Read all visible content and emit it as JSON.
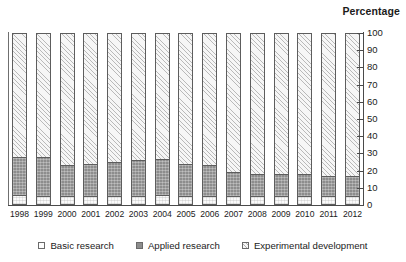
{
  "chart_data": {
    "type": "bar",
    "subtype": "stacked-percentage",
    "title": "Percentage",
    "xlabel": "",
    "ylabel": "Percentage",
    "ylim": [
      0,
      100
    ],
    "yticks": [
      0,
      10,
      20,
      30,
      40,
      50,
      60,
      70,
      80,
      90,
      100
    ],
    "grid": false,
    "legend_position": "bottom",
    "axis_side": "right",
    "categories": [
      "1998",
      "1999",
      "2000",
      "2001",
      "2002",
      "2003",
      "2004",
      "2005",
      "2006",
      "2007",
      "2008",
      "2009",
      "2010",
      "2011",
      "2012"
    ],
    "series": [
      {
        "name": "Basic research",
        "color": "#fafafa",
        "pattern": "light-speckle",
        "values": [
          6,
          5,
          5,
          5,
          5,
          5,
          6,
          5,
          5,
          5,
          5,
          5,
          5,
          5,
          5
        ]
      },
      {
        "name": "Applied research",
        "color": "#8d8d8d",
        "pattern": "dark-stipple",
        "values": [
          22,
          23,
          18,
          19,
          20,
          21,
          21,
          19,
          18,
          14,
          13,
          13,
          13,
          12,
          12
        ]
      },
      {
        "name": "Experimental development",
        "color": "#f2f2f2",
        "pattern": "diagonal-hatch",
        "values": [
          72,
          72,
          77,
          76,
          75,
          74,
          73,
          76,
          77,
          81,
          82,
          82,
          82,
          83,
          83
        ]
      }
    ],
    "stack_tops": {
      "basic_research": [
        6,
        5,
        5,
        5,
        5,
        5,
        6,
        5,
        5,
        5,
        5,
        5,
        5,
        5,
        5
      ],
      "applied_research_cumulative": [
        28,
        28,
        23,
        24,
        25,
        26,
        27,
        24,
        23,
        19,
        18,
        18,
        18,
        17,
        17
      ]
    }
  },
  "legend": {
    "items": [
      {
        "label": "Basic research",
        "swatch": "basic"
      },
      {
        "label": "Applied research",
        "swatch": "applied"
      },
      {
        "label": "Experimental development",
        "swatch": "exp"
      }
    ]
  }
}
